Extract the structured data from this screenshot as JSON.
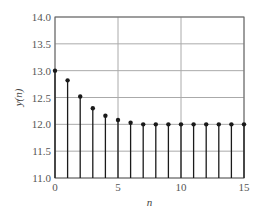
{
  "chart_data": {
    "type": "stem",
    "title": "",
    "xlabel": "n",
    "ylabel": "y(n)",
    "x": [
      0,
      1,
      2,
      3,
      4,
      5,
      6,
      7,
      8,
      9,
      10,
      11,
      12,
      13,
      14,
      15
    ],
    "values": [
      13.0,
      12.82,
      12.52,
      12.3,
      12.16,
      12.08,
      12.03,
      12.0,
      12.0,
      12.0,
      12.0,
      12.0,
      12.0,
      12.0,
      12.0,
      12.0
    ],
    "xlim": [
      0,
      15
    ],
    "ylim": [
      11.0,
      14.0
    ],
    "xticks": [
      "0",
      "5",
      "10",
      "15"
    ],
    "yticks": [
      "11.0",
      "11.5",
      "12.0",
      "12.5",
      "13.0",
      "13.5",
      "14.0"
    ],
    "grid": true,
    "legend": null,
    "colors": {
      "stem": "#1a1a1a",
      "grid": "#aaaaaa",
      "axis": "#666666"
    }
  }
}
